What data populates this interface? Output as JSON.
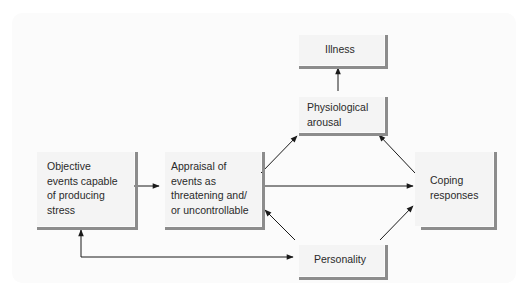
{
  "diagram": {
    "title": "",
    "nodes": [
      {
        "id": "objective_events",
        "label": "Objective\nevents capable\nof producing\nstress"
      },
      {
        "id": "appraisal",
        "label": "Appraisal of\nevents as\nthreatening and/\nor uncontrollable"
      },
      {
        "id": "physiological_arousal",
        "label": "Physiological\narousal"
      },
      {
        "id": "illness",
        "label": "Illness"
      },
      {
        "id": "coping_responses",
        "label": "Coping\nresponses"
      },
      {
        "id": "personality",
        "label": "Personality"
      }
    ],
    "edges": [
      {
        "from": "objective_events",
        "to": "appraisal"
      },
      {
        "from": "appraisal",
        "to": "physiological_arousal"
      },
      {
        "from": "appraisal",
        "to": "coping_responses"
      },
      {
        "from": "physiological_arousal",
        "to": "illness"
      },
      {
        "from": "coping_responses",
        "to": "physiological_arousal"
      },
      {
        "from": "personality",
        "to": "appraisal"
      },
      {
        "from": "personality",
        "to": "coping_responses"
      },
      {
        "from": "personality",
        "to": "objective_events",
        "bidirectional": true
      }
    ],
    "colors": {
      "box_fill": "#f4f4f4",
      "box_shadow": "#8c8c8c",
      "arrow": "#1a1a1a",
      "text": "#2a2a2a"
    }
  }
}
